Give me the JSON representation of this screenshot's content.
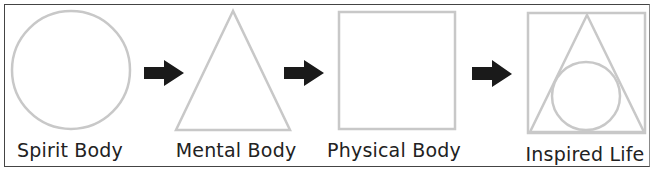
{
  "diagram": {
    "stages": [
      {
        "label": "Spirit Body",
        "shape": "circle"
      },
      {
        "label": "Mental Body",
        "shape": "triangle"
      },
      {
        "label": "Physical Body",
        "shape": "square"
      },
      {
        "label": "Inspired Life",
        "shape": "square-triangle-circle"
      }
    ],
    "arrows": 3,
    "colors": {
      "shape_stroke": "#c8c8c8",
      "arrow_fill": "#1a1a1a",
      "border": "#444444",
      "text": "#222222"
    }
  }
}
